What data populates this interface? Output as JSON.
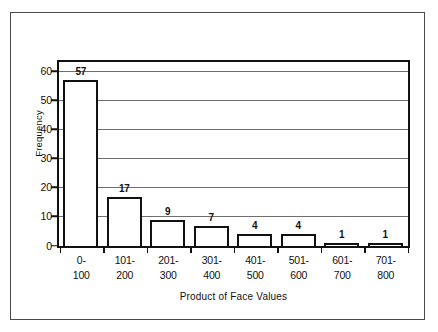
{
  "chart_data": {
    "type": "bar",
    "title": "",
    "subtitle": "",
    "xlabel": "Product of Face Values",
    "ylabel": "Frequency",
    "categories": [
      "0-\n100",
      "101-\n200",
      "201-\n300",
      "301-\n400",
      "401-\n500",
      "501-\n600",
      "601-\n700",
      "701-\n800"
    ],
    "category_parts": [
      {
        "lo": "0-",
        "hi": "100"
      },
      {
        "lo": "101-",
        "hi": "200"
      },
      {
        "lo": "201-",
        "hi": "300"
      },
      {
        "lo": "301-",
        "hi": "400"
      },
      {
        "lo": "401-",
        "hi": "500"
      },
      {
        "lo": "501-",
        "hi": "600"
      },
      {
        "lo": "601-",
        "hi": "700"
      },
      {
        "lo": "701-",
        "hi": "800"
      }
    ],
    "values": [
      57,
      17,
      9,
      7,
      4,
      4,
      1,
      1
    ],
    "data_labels": [
      "57",
      "17",
      "9",
      "7",
      "4",
      "4",
      "1",
      "1"
    ],
    "ylim": [
      0,
      63
    ],
    "yticks": [
      0,
      10,
      20,
      30,
      40,
      50,
      60
    ],
    "ytick_labels": [
      "0",
      "10",
      "20",
      "30",
      "40",
      "50",
      "60"
    ],
    "grid": true,
    "grid_axis": "y",
    "legend": false,
    "legend_position": "none",
    "bar_fill": "#ffffff",
    "bar_edge": "#111111",
    "grid_color": "#6e6e6e",
    "frame_color": "#111111",
    "background": "#ffffff"
  }
}
